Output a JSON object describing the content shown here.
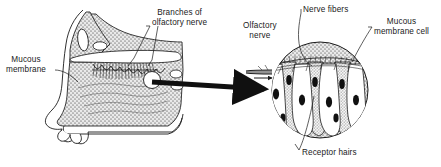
{
  "figure": {
    "style": "black-and-white line drawing with gray stipple shading",
    "background_color": "#ffffff",
    "ink_color": "#1a1a1a",
    "stipple_color": "#8c8c8c",
    "panels": [
      {
        "name": "nasal-cavity-sagittal-section",
        "position": "left",
        "description": "Sagittal cut-away of the human nose and nasal cavity showing the mucous membrane lining, the frontal sinus, the turbinates and the olfactory nerve branches entering through the cribriform plate"
      },
      {
        "name": "olfactory-epithelium-inset",
        "position": "right",
        "shape": "circle",
        "description": "Circular magnified view of the olfactory epithelium showing columnar mucous membrane cells with dark nuclei, receptor hairs at the surface and nerve fibers gathering into the olfactory nerve"
      }
    ],
    "connector": {
      "name": "magnification-arrow",
      "shape": "thick solid arrow",
      "direction": "left-to-right",
      "from": "olfactory region of nasal cavity",
      "to": "magnified circular inset"
    }
  },
  "labels": {
    "mucous_membrane": "Mucous\nmembrane",
    "mucous_membrane_line1": "Mucous",
    "mucous_membrane_line2": "membrane",
    "branches_line1": "Branches of",
    "branches_line2": "olfactory nerve",
    "nerve_fibers": "Nerve fibers",
    "olfactory_nerve_line1": "Olfactory",
    "olfactory_nerve_line2": "nerve",
    "mucous_cell_line1": "Mucous",
    "mucous_cell_line2": "membrane cell",
    "receptor_hairs": "Receptor hairs"
  }
}
